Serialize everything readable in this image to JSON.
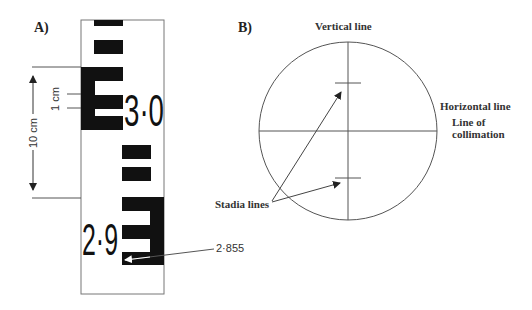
{
  "panel_a": {
    "label": "A)",
    "staff": {
      "numbers": [
        "3·0",
        "2·9"
      ]
    },
    "dimension_10cm": "10 cm",
    "dimension_1cm": "1 cm",
    "reading_label": "2·855"
  },
  "panel_b": {
    "label": "B)",
    "vertical_line_label": "Vertical line",
    "horizontal_line_label": "Horizontal line",
    "collimation_label_line1": "Line of",
    "collimation_label_line2": "collimation",
    "stadia_label": "Stadia lines"
  },
  "colors": {
    "ink": "#111111",
    "line": "#555555",
    "background": "#ffffff"
  }
}
